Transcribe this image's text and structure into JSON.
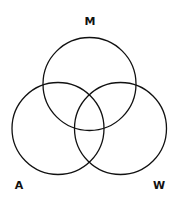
{
  "diagram": {
    "type": "venn",
    "sets": [
      {
        "label": "M",
        "cx": 89.5,
        "cy": 84,
        "r": 46.5,
        "label_x": 90,
        "label_y": 25
      },
      {
        "label": "A",
        "cx": 58,
        "cy": 128.5,
        "r": 46,
        "label_x": 19,
        "label_y": 189
      },
      {
        "label": "W",
        "cx": 120.5,
        "cy": 128.5,
        "r": 46,
        "label_x": 159,
        "label_y": 189
      }
    ],
    "stroke_color": "#111111",
    "background": "#ffffff"
  }
}
